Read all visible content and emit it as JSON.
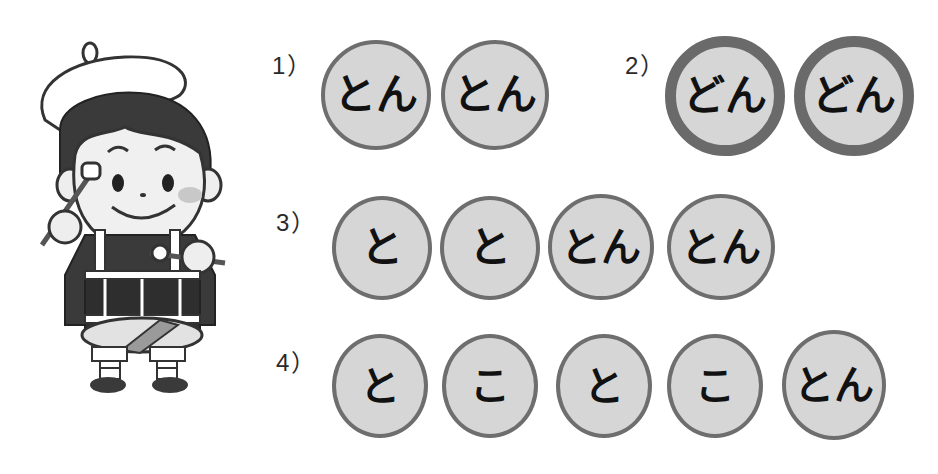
{
  "illustration": {
    "subject": "drummer-boy",
    "description": "Boy in beret playing a snare drum with sticks"
  },
  "colors": {
    "circle_fill": "#d6d6d6",
    "circle_border": "#6e6e6e",
    "strong_border": "#6a6a6a",
    "text": "#111111"
  },
  "exercises": [
    {
      "label": "1）",
      "beats": [
        {
          "text": "とん",
          "emphasis": "normal"
        },
        {
          "text": "とん",
          "emphasis": "normal"
        }
      ]
    },
    {
      "label": "2）",
      "beats": [
        {
          "text": "どん",
          "emphasis": "strong"
        },
        {
          "text": "どん",
          "emphasis": "strong"
        }
      ]
    },
    {
      "label": "3）",
      "beats": [
        {
          "text": "と",
          "emphasis": "normal"
        },
        {
          "text": "と",
          "emphasis": "normal"
        },
        {
          "text": "とん",
          "emphasis": "normal"
        },
        {
          "text": "とん",
          "emphasis": "normal"
        }
      ]
    },
    {
      "label": "4）",
      "beats": [
        {
          "text": "と",
          "emphasis": "normal"
        },
        {
          "text": "こ",
          "emphasis": "normal"
        },
        {
          "text": "と",
          "emphasis": "normal"
        },
        {
          "text": "こ",
          "emphasis": "normal"
        },
        {
          "text": "とん",
          "emphasis": "normal"
        }
      ]
    }
  ]
}
